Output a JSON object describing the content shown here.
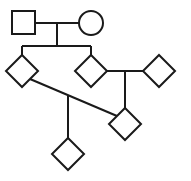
{
  "diagram": {
    "type": "pedigree",
    "colors": {
      "stroke": "#1a1a1a",
      "fill": "#ffffff",
      "background": "#ffffff"
    },
    "nodes": [
      {
        "id": "parent-male",
        "shape": "square",
        "x": 12,
        "y": 11,
        "size": 23
      },
      {
        "id": "parent-female",
        "shape": "circle",
        "cx": 91,
        "cy": 23,
        "r": 12
      },
      {
        "id": "child-1",
        "shape": "diamond",
        "cx": 22,
        "cy": 71,
        "r": 16
      },
      {
        "id": "child-2",
        "shape": "diamond",
        "cx": 91,
        "cy": 71,
        "r": 16
      },
      {
        "id": "partner-of-child-2",
        "shape": "diamond",
        "cx": 159,
        "cy": 71,
        "r": 16
      },
      {
        "id": "offspring-of-child-2",
        "shape": "diamond",
        "cx": 125,
        "cy": 124,
        "r": 16
      },
      {
        "id": "offspring-of-child-1-and-grandchild",
        "shape": "diamond",
        "cx": 68,
        "cy": 154,
        "r": 16
      }
    ]
  }
}
